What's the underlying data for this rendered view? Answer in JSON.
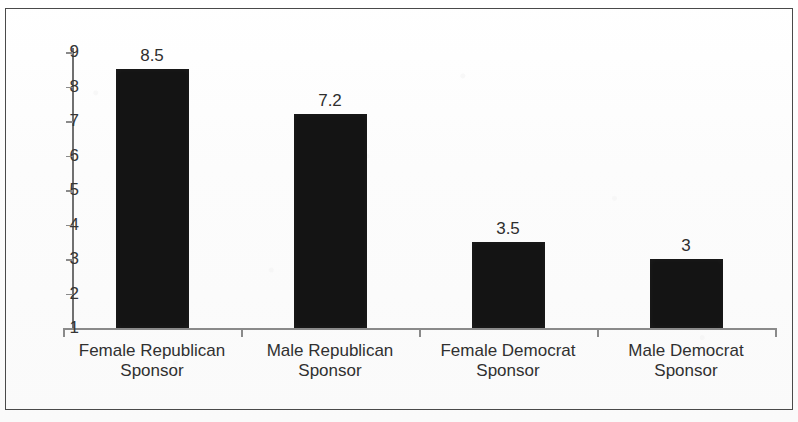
{
  "chart_data": {
    "type": "bar",
    "title": "",
    "subtitle": "",
    "xlabel": "",
    "ylabel": "",
    "categories": [
      "Female Republican Sponsor",
      "Male Republican Sponsor",
      "Female Democrat Sponsor",
      "Male Democrat Sponsor"
    ],
    "category_lines": [
      [
        "Female Republican",
        "Sponsor"
      ],
      [
        "Male Republican",
        "Sponsor"
      ],
      [
        "Female Democrat",
        "Sponsor"
      ],
      [
        "Male Democrat",
        "Sponsor"
      ]
    ],
    "values": [
      8.5,
      7.2,
      3.5,
      3
    ],
    "value_labels": [
      "8.5",
      "7.2",
      "3.5",
      "3"
    ],
    "ylim": [
      1,
      9
    ],
    "yticks": [
      1,
      2,
      3,
      4,
      5,
      6,
      7,
      8,
      9
    ],
    "ytick_labels": [
      "1",
      "2",
      "3",
      "4",
      "5",
      "6",
      "7",
      "8",
      "9"
    ],
    "grid": false,
    "legend": null,
    "legend_position": "none",
    "bar_color": "#141414",
    "axis_color": "#8a8a8a",
    "text_color": "#303030",
    "background_color": "#ffffff",
    "frame_border_color": "#4a4a4a"
  }
}
